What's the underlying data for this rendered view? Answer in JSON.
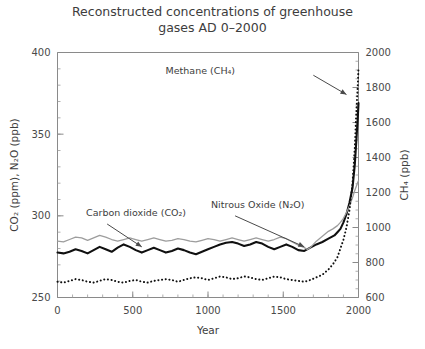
{
  "chart_data": {
    "type": "line",
    "title": "Reconstructed concentrations of greenhouse gases AD 0–2000",
    "title_line1": "Reconstructed concentrations of greenhouse",
    "title_line2": "gases AD 0–2000",
    "xlabel": "Year",
    "ylabel_left": "CO₂ (ppm), N₂O (ppb)",
    "ylabel_right": "CH₄ (ppb)",
    "xlim": [
      0,
      2000
    ],
    "ylim_left": [
      250,
      400
    ],
    "ylim_right": [
      600,
      2000
    ],
    "xticks": [
      0,
      500,
      1000,
      1500,
      2000
    ],
    "xticklabels": [
      "0",
      "500",
      "1000",
      "1500",
      "2000"
    ],
    "xminor_step": 100,
    "yticks_left": [
      250,
      300,
      350,
      400
    ],
    "yticklabels_left": [
      "250",
      "300",
      "350",
      "400"
    ],
    "yminor_left_step": 10,
    "yticks_right": [
      600,
      800,
      1000,
      1200,
      1400,
      1600,
      1800,
      2000
    ],
    "yticklabels_right": [
      "600",
      "800",
      "1000",
      "1200",
      "1400",
      "1600",
      "1800",
      "2000"
    ],
    "yminor_right_step": 50,
    "grid": false,
    "legend_position": "annotations-inline",
    "colors": {
      "co2": "#101010",
      "n2o": "#9d9d9d",
      "ch4": "#101010",
      "axis": "#8a8a8a",
      "text": "#3d3d3d"
    },
    "annotations": [
      {
        "name": "methane-label",
        "text": "Methane (CH₄)",
        "x": 1180,
        "y": 1880,
        "axis": "right",
        "arrow_from": [
          1700,
          1870
        ],
        "arrow_to": [
          1920,
          1760
        ]
      },
      {
        "name": "nitrous-oxide-label",
        "text": "Nitrous Oxide (N₂O)",
        "x": 1020,
        "y": 305,
        "axis": "left",
        "arrow_from": [
          1180,
          300
        ],
        "arrow_to": [
          1640,
          281
        ]
      },
      {
        "name": "carbon-dioxide-label",
        "text": "Carbon dioxide (CO₂)",
        "x": 190,
        "y": 300,
        "axis": "left",
        "arrow_from": [
          330,
          295
        ],
        "arrow_to": [
          560,
          281
        ]
      }
    ],
    "series": [
      {
        "name": "Carbon dioxide (CO2)",
        "key": "co2",
        "axis": "left",
        "unit": "ppm",
        "style": "solid-thick",
        "color": "#101010",
        "x": [
          0,
          40,
          80,
          120,
          160,
          200,
          240,
          280,
          320,
          360,
          400,
          440,
          480,
          520,
          560,
          600,
          640,
          680,
          720,
          760,
          800,
          840,
          880,
          920,
          960,
          1000,
          1040,
          1080,
          1120,
          1160,
          1200,
          1240,
          1280,
          1320,
          1360,
          1400,
          1440,
          1480,
          1520,
          1560,
          1600,
          1640,
          1680,
          1720,
          1760,
          1800,
          1840,
          1860,
          1880,
          1900,
          1920,
          1940,
          1960,
          1975,
          1985,
          1995,
          2000
        ],
        "y": [
          277.5,
          277.0,
          278.0,
          279.5,
          278.5,
          277.0,
          279.0,
          281.0,
          279.5,
          278.0,
          280.5,
          282.5,
          281.0,
          279.0,
          277.5,
          279.0,
          280.5,
          279.0,
          277.5,
          278.5,
          280.0,
          279.0,
          277.5,
          276.5,
          278.0,
          279.5,
          281.0,
          282.5,
          283.5,
          284.0,
          283.0,
          281.5,
          282.5,
          284.0,
          283.0,
          281.0,
          279.5,
          281.0,
          282.5,
          281.0,
          279.0,
          278.5,
          280.5,
          282.5,
          284.0,
          286.0,
          288.0,
          290.0,
          292.0,
          296.0,
          301.0,
          308.0,
          317.0,
          331.0,
          345.0,
          360.0,
          369.0
        ]
      },
      {
        "name": "Nitrous Oxide (N2O)",
        "key": "n2o",
        "axis": "left",
        "unit": "ppb",
        "style": "solid-thin",
        "color": "#9d9d9d",
        "x": [
          0,
          40,
          80,
          120,
          160,
          200,
          240,
          280,
          320,
          360,
          400,
          440,
          480,
          520,
          560,
          600,
          640,
          680,
          720,
          760,
          800,
          840,
          880,
          920,
          960,
          1000,
          1040,
          1080,
          1120,
          1160,
          1200,
          1240,
          1280,
          1320,
          1360,
          1400,
          1440,
          1480,
          1520,
          1560,
          1600,
          1640,
          1660,
          1680,
          1700,
          1720,
          1740,
          1760,
          1780,
          1800,
          1830,
          1860,
          1880,
          1900,
          1920,
          1940,
          1960,
          1975,
          1985,
          1995,
          2000
        ],
        "y": [
          284.5,
          284.0,
          285.5,
          287.0,
          286.5,
          285.0,
          286.5,
          288.0,
          287.0,
          285.5,
          284.5,
          285.5,
          286.5,
          285.5,
          284.5,
          285.5,
          286.5,
          285.5,
          284.5,
          285.0,
          286.0,
          285.5,
          284.5,
          284.0,
          285.0,
          286.0,
          285.5,
          284.5,
          285.5,
          286.5,
          285.5,
          284.5,
          285.5,
          286.5,
          285.5,
          284.5,
          285.5,
          287.0,
          286.0,
          284.0,
          282.0,
          280.5,
          279.5,
          280.5,
          282.5,
          284.5,
          286.0,
          287.5,
          289.0,
          290.5,
          292.0,
          294.0,
          296.0,
          298.5,
          302.0,
          306.0,
          311.0,
          315.5,
          318.0,
          320.5,
          321.5
        ]
      },
      {
        "name": "Methane (CH4)",
        "key": "ch4",
        "axis": "right",
        "unit": "ppb",
        "style": "dotted",
        "color": "#101010",
        "x": [
          0,
          40,
          80,
          120,
          160,
          200,
          240,
          280,
          320,
          360,
          400,
          440,
          480,
          520,
          560,
          600,
          640,
          680,
          720,
          760,
          800,
          840,
          880,
          920,
          960,
          1000,
          1040,
          1080,
          1120,
          1160,
          1200,
          1240,
          1280,
          1320,
          1360,
          1400,
          1440,
          1480,
          1520,
          1560,
          1600,
          1640,
          1680,
          1720,
          1760,
          1800,
          1830,
          1860,
          1880,
          1900,
          1920,
          1940,
          1960,
          1975,
          1985,
          1995,
          2000
        ],
        "y": [
          690,
          685,
          695,
          705,
          700,
          690,
          685,
          695,
          705,
          700,
          690,
          685,
          695,
          700,
          690,
          685,
          695,
          700,
          705,
          700,
          690,
          700,
          710,
          715,
          710,
          700,
          710,
          720,
          715,
          705,
          710,
          720,
          715,
          705,
          700,
          710,
          720,
          715,
          705,
          700,
          695,
          690,
          700,
          715,
          730,
          760,
          790,
          830,
          880,
          930,
          1000,
          1100,
          1250,
          1450,
          1650,
          1810,
          1910
        ]
      }
    ]
  }
}
